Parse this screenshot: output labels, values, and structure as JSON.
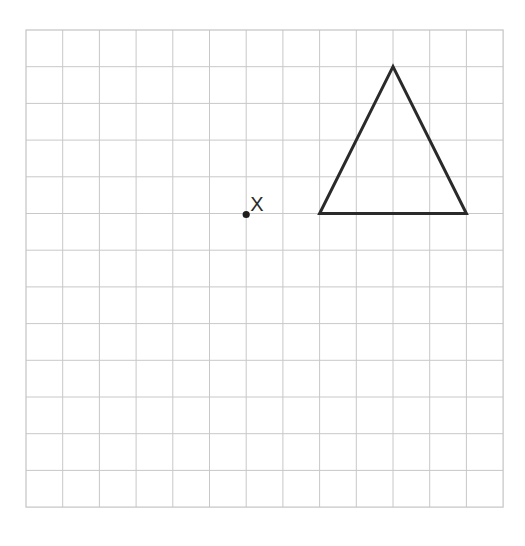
{
  "diagram": {
    "type": "square-grid",
    "grid": {
      "columns": 13,
      "rows": 13,
      "origin_px": [
        26,
        30
      ],
      "cell_px": 36.7,
      "line_color": "#c8c8c8"
    },
    "shapes": [
      {
        "name": "triangle",
        "kind": "isosceles-triangle",
        "stroke_color": "#2a2a2a",
        "vertices_grid": [
          [
            10,
            1
          ],
          [
            8,
            5
          ],
          [
            12,
            5
          ]
        ]
      }
    ],
    "points": [
      {
        "name": "center-of-enlargement",
        "label": "X",
        "position_grid": [
          6,
          5
        ],
        "color": "#1e1e1e"
      }
    ]
  }
}
